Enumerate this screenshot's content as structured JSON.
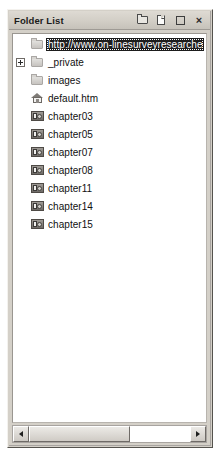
{
  "panel": {
    "title": "Folder List",
    "titlebar_buttons": [
      {
        "name": "new-folder-icon",
        "label": "",
        "icon": "new-folder-icon"
      },
      {
        "name": "new-page-icon",
        "label": "",
        "icon": "new-page-icon"
      },
      {
        "name": "restore-icon",
        "label": "",
        "icon": "restore-window-icon"
      },
      {
        "name": "close-icon",
        "label": "×",
        "icon": "close-icon"
      }
    ]
  },
  "tree": {
    "items": [
      {
        "label": "http://www.on-linesurveyresearche",
        "icon": "web-root-folder-icon",
        "indent": 0,
        "expander": "none",
        "selected": true
      },
      {
        "label": "_private",
        "icon": "folder-icon",
        "indent": 0,
        "expander": "plus",
        "selected": false
      },
      {
        "label": "images",
        "icon": "folder-icon",
        "indent": 0,
        "expander": "none",
        "selected": false
      },
      {
        "label": "default.htm",
        "icon": "home-page-icon",
        "indent": 0,
        "expander": "none",
        "selected": false
      },
      {
        "label": "chapter03",
        "icon": "web-folder-icon",
        "indent": 0,
        "expander": "none",
        "selected": false
      },
      {
        "label": "chapter05",
        "icon": "web-folder-icon",
        "indent": 0,
        "expander": "none",
        "selected": false
      },
      {
        "label": "chapter07",
        "icon": "web-folder-icon",
        "indent": 0,
        "expander": "none",
        "selected": false
      },
      {
        "label": "chapter08",
        "icon": "web-folder-icon",
        "indent": 0,
        "expander": "none",
        "selected": false
      },
      {
        "label": "chapter11",
        "icon": "web-folder-icon",
        "indent": 0,
        "expander": "none",
        "selected": false
      },
      {
        "label": "chapter14",
        "icon": "web-folder-icon",
        "indent": 0,
        "expander": "none",
        "selected": false
      },
      {
        "label": "chapter15",
        "icon": "web-folder-icon",
        "indent": 0,
        "expander": "none",
        "selected": false
      }
    ]
  },
  "scrollbar": {
    "left_arrow": "◄",
    "right_arrow": "►",
    "thumb_fraction_percent": 63
  },
  "colors": {
    "panel_face": "#d4d0c8",
    "list_background": "#ffffff",
    "selection_background": "#1d1d1d",
    "selection_text": "#ffffff",
    "text": "#101010"
  }
}
